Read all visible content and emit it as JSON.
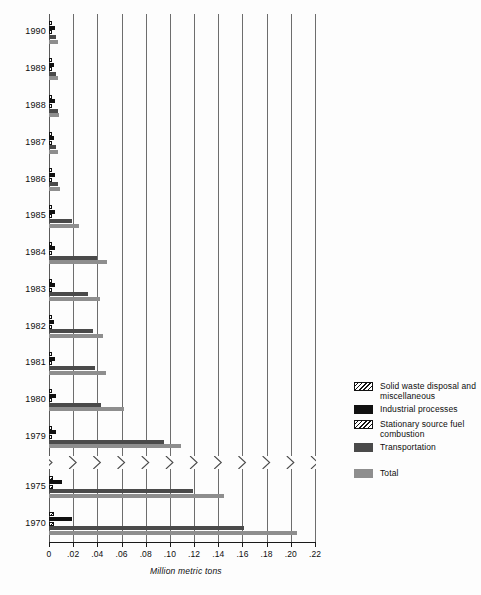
{
  "chart_data": {
    "type": "bar",
    "orientation": "horizontal",
    "title": "",
    "xlabel": "Million metric tons",
    "ylabel": "",
    "xlim": [
      0,
      0.22
    ],
    "xticks": [
      "0",
      ".02",
      ".04",
      ".06",
      ".08",
      ".10",
      ".12",
      ".14",
      ".16",
      ".18",
      ".20",
      ".22"
    ],
    "xtick_values": [
      0,
      0.02,
      0.04,
      0.06,
      0.08,
      0.1,
      0.12,
      0.14,
      0.16,
      0.18,
      0.2,
      0.22
    ],
    "grid": true,
    "axis_break": true,
    "axis_break_note": "Zigzag break in time axis between 1979 and 1975",
    "legend_position": "right",
    "categories": [
      "1990",
      "1989",
      "1988",
      "1987",
      "1986",
      "1985",
      "1984",
      "1983",
      "1982",
      "1981",
      "1980",
      "1979",
      "1975",
      "1970"
    ],
    "series": [
      {
        "name": "Solid waste disposal and miscellaneous",
        "color": "#ffffff",
        "pattern": "hatched",
        "values": [
          0.0015,
          0.0015,
          0.0016,
          0.0015,
          0.0016,
          0.0016,
          0.0017,
          0.0017,
          0.0017,
          0.0017,
          0.0018,
          0.0019,
          0.0034,
          0.0042
        ]
      },
      {
        "name": "Industrial processes",
        "color": "#111111",
        "pattern": "solid",
        "values": [
          0.0046,
          0.0043,
          0.005,
          0.0042,
          0.0051,
          0.0046,
          0.005,
          0.005,
          0.0045,
          0.0046,
          0.0055,
          0.006,
          0.011,
          0.019
        ]
      },
      {
        "name": "Stationary source fuel combustion",
        "color": "#ffffff",
        "pattern": "hatched",
        "values": [
          0.0013,
          0.0013,
          0.0014,
          0.0013,
          0.0014,
          0.0014,
          0.0015,
          0.0015,
          0.0015,
          0.0015,
          0.0016,
          0.0017,
          0.003,
          0.0038
        ]
      },
      {
        "name": "Transportation",
        "color": "#4a4a4a",
        "pattern": "solid",
        "values": [
          0.0062,
          0.006,
          0.0071,
          0.006,
          0.0073,
          0.019,
          0.04,
          0.032,
          0.036,
          0.038,
          0.043,
          0.095,
          0.119,
          0.161
        ]
      },
      {
        "name": "Total",
        "color": "#8e8e8e",
        "pattern": "solid",
        "values": [
          0.0078,
          0.0074,
          0.0086,
          0.0074,
          0.0088,
          0.025,
          0.048,
          0.042,
          0.045,
          0.047,
          0.062,
          0.109,
          0.145,
          0.205
        ]
      }
    ]
  },
  "legend": {
    "items": [
      {
        "label": "Solid waste disposal and miscellaneous",
        "swatch": "hatch",
        "spaced": false
      },
      {
        "label": "Industrial processes",
        "swatch": "black",
        "spaced": false
      },
      {
        "label": "Stationary source fuel combustion",
        "swatch": "hatch",
        "spaced": false
      },
      {
        "label": "Transportation",
        "swatch": "darkgray",
        "spaced": false
      },
      {
        "label": "Total",
        "swatch": "gray",
        "spaced": true
      }
    ]
  },
  "axis": {
    "xtitle": "Million metric tons"
  }
}
